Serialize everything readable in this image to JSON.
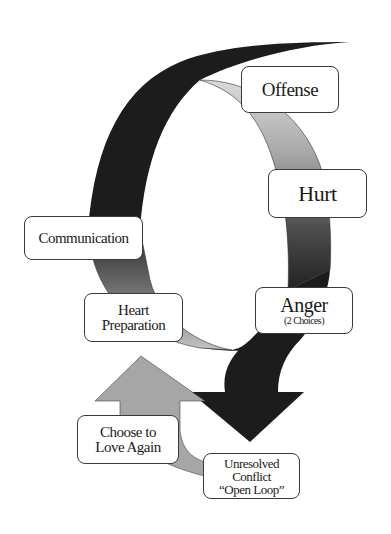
{
  "diagram": {
    "type": "conflict-cycle",
    "colors": {
      "dark_band": "#1c1c1c",
      "grey_band_light": "#d4d4d4",
      "grey_band_mid": "#9a9a9a",
      "grey_band_dark": "#4a4a4a",
      "up_arrow": "#a6a6a6",
      "box_border": "#3a3a3a",
      "box_fill": "#ffffff",
      "text": "#1a1a1a"
    },
    "labels": {
      "offense": {
        "text": "Offense"
      },
      "hurt": {
        "text": "Hurt"
      },
      "anger": {
        "text": "Anger",
        "subtext": "(2 Choices)"
      },
      "unresolved": {
        "line1": "Unresolved",
        "line2": "Conflict",
        "line3": "“Open Loop”"
      },
      "choose": {
        "line1": "Choose to",
        "line2": "Love Again"
      },
      "heart": {
        "line1": "Heart",
        "line2": "Preparation"
      },
      "communication": {
        "text": "Communication"
      }
    }
  }
}
